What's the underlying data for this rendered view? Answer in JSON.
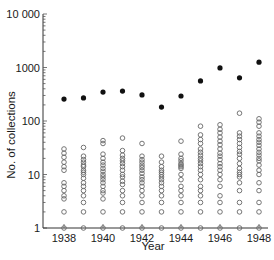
{
  "chart_data": {
    "type": "scatter",
    "title": "",
    "xlabel": "Year",
    "ylabel": "No. of collections",
    "yscale": "log",
    "ylim": [
      1,
      10000
    ],
    "xlim": [
      1937.5,
      1948.5
    ],
    "x_ticks": [
      1938,
      1940,
      1942,
      1944,
      1946,
      1948
    ],
    "x_tick_labels": [
      "1938",
      "1940",
      "1942",
      "1944",
      "1946",
      "1948"
    ],
    "y_ticks": [
      1,
      10,
      100,
      1000,
      10000
    ],
    "y_tick_labels": [
      "1",
      "10",
      "100",
      "1000",
      "10 000"
    ],
    "grid": false,
    "legend": null,
    "series": [
      {
        "name": "Total collections per year",
        "marker": "filled-circle",
        "x": [
          1938,
          1939,
          1940,
          1941,
          1942,
          1943,
          1944,
          1945,
          1946,
          1947,
          1948
        ],
        "values": [
          257,
          270,
          348,
          362,
          307,
          182,
          293,
          560,
          980,
          640,
          1260
        ]
      },
      {
        "name": "Collections per individual",
        "marker": "open-circle",
        "points": {
          "1938": [
            30,
            25,
            21,
            17,
            14,
            12,
            7,
            6,
            5,
            4,
            3.5,
            2,
            1
          ],
          "1939": [
            32,
            22,
            19,
            17,
            15,
            14,
            12,
            11,
            10,
            8.5,
            7,
            6,
            5,
            4,
            3,
            2,
            1
          ],
          "1940": [
            43,
            38,
            24,
            20,
            17,
            15,
            13,
            11.5,
            10,
            9,
            8,
            7,
            6,
            5,
            4.5,
            3.5,
            2,
            1
          ],
          "1941": [
            48,
            28,
            23,
            20,
            18,
            16,
            14,
            12,
            10,
            9,
            7.5,
            6.5,
            5,
            4,
            3,
            2,
            1
          ],
          "1942": [
            38,
            22,
            19,
            17,
            15,
            13.5,
            12,
            10.5,
            9,
            8,
            7,
            6,
            5,
            4,
            3,
            2,
            1
          ],
          "1943": [
            22,
            17,
            14,
            12,
            11,
            10,
            9,
            8,
            7,
            6,
            5,
            4,
            3,
            2,
            1
          ],
          "1944": [
            42,
            24,
            20,
            18,
            16,
            15,
            14,
            13,
            10,
            8,
            6,
            5,
            4,
            3,
            2,
            1
          ],
          "1945": [
            80,
            55,
            45,
            38,
            30,
            26,
            23,
            20,
            18,
            16,
            14,
            12,
            10,
            8,
            6,
            5,
            4,
            3,
            2,
            1
          ],
          "1946": [
            85,
            70,
            60,
            50,
            42,
            36,
            30,
            25,
            22,
            19,
            16,
            14,
            12,
            10,
            8,
            6,
            4,
            3,
            2,
            1
          ],
          "1947": [
            140,
            60,
            52,
            45,
            38,
            32,
            27,
            24,
            20,
            16,
            13,
            11,
            10,
            9,
            7,
            5,
            3,
            2,
            1
          ],
          "1948": [
            110,
            95,
            80,
            60,
            52,
            45,
            40,
            35,
            30,
            26,
            23,
            20,
            18,
            15,
            12,
            10,
            7,
            5,
            3,
            2,
            1
          ]
        }
      }
    ]
  }
}
